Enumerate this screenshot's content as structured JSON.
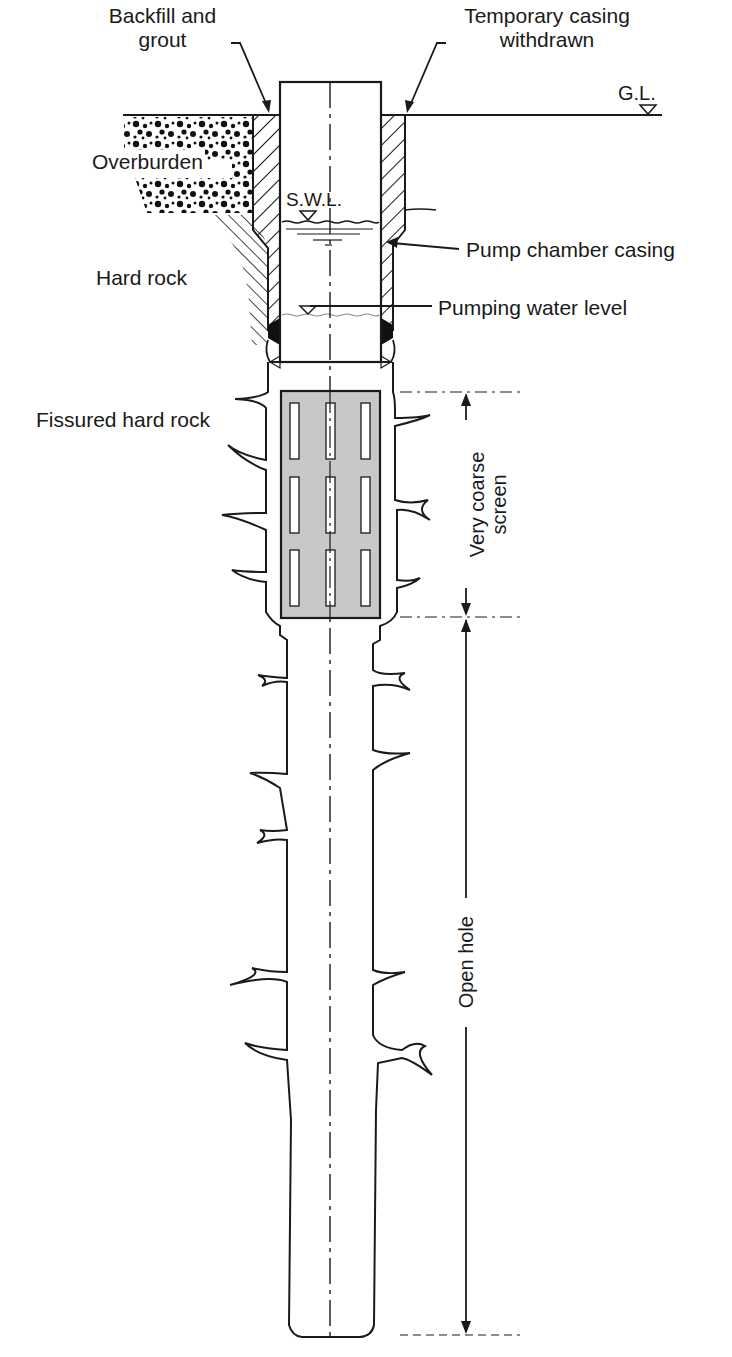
{
  "diagram": {
    "labels": {
      "backfill": "Backfill and\ngrout",
      "backfill_line1": "Backfill and",
      "backfill_line2": "grout",
      "temp_casing_line1": "Temporary casing",
      "temp_casing_line2": "withdrawn",
      "ground_level": "G.L.",
      "overburden": "Overburden",
      "swl": "S.W.L.",
      "pump_chamber_casing": "Pump chamber casing",
      "hard_rock": "Hard rock",
      "pumping_water_level": "Pumping water level",
      "fissured_hard_rock": "Fissured hard rock",
      "screen_line1": "Very coarse",
      "screen_line2": "screen",
      "open_hole": "Open hole"
    },
    "colors": {
      "line": "#1a1a1a",
      "screen_fill": "#c8c8c8",
      "background": "#ffffff"
    }
  }
}
